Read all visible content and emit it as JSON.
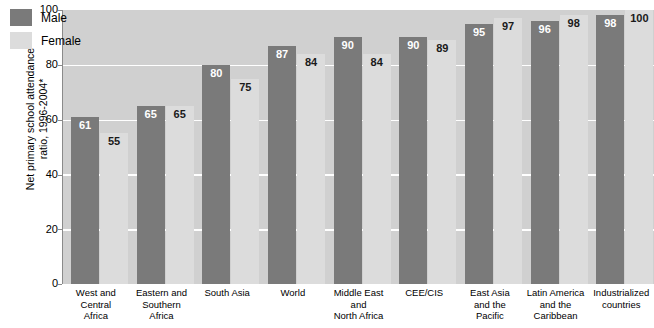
{
  "chart_data": {
    "type": "bar",
    "title": "",
    "subtitle": "",
    "xlabel": "",
    "ylabel": "Net primary school attendance ratio, 1996-2004*",
    "ylabel_lines": [
      "Net primary school attendance",
      "ratio, 1996-2004*"
    ],
    "ylim": [
      0,
      100
    ],
    "yticks": [
      100,
      80,
      60,
      40,
      20,
      0
    ],
    "ytick_labels": [
      "100",
      "80",
      "60",
      "40",
      "20",
      "0"
    ],
    "gridlines": [
      80,
      60,
      40,
      20
    ],
    "grid": true,
    "legend_position": "top-left",
    "categories": [
      "West and Central Africa",
      "Eastern and Southern Africa",
      "South Asia",
      "World",
      "Middle East and North Africa",
      "CEE/CIS",
      "East Asia and the Pacific",
      "Latin America and the Caribbean",
      "Industrialized countries"
    ],
    "category_lines": [
      [
        "West and",
        "Central",
        "Africa"
      ],
      [
        "Eastern and",
        "Southern",
        "Africa"
      ],
      [
        "South Asia"
      ],
      [
        "World"
      ],
      [
        "Middle East and",
        "North Africa"
      ],
      [
        "CEE/CIS"
      ],
      [
        "East Asia",
        "and the",
        "Pacific"
      ],
      [
        "Latin America",
        "and the",
        "Caribbean"
      ],
      [
        "Industrialized",
        "countries"
      ]
    ],
    "series": [
      {
        "name": "Male",
        "color": "#7a7a7a",
        "values": [
          61,
          65,
          80,
          87,
          90,
          90,
          95,
          96,
          98
        ]
      },
      {
        "name": "Female",
        "color": "#dcdcdc",
        "values": [
          55,
          65,
          75,
          84,
          84,
          89,
          97,
          98,
          100
        ]
      }
    ]
  },
  "legend": {
    "items": [
      {
        "label": "Male",
        "color": "#7a7a7a"
      },
      {
        "label": "Female",
        "color": "#dcdcdc"
      }
    ]
  },
  "colors": {
    "male": "#7a7a7a",
    "female": "#dcdcdc",
    "plot_background": "#d0d0d0",
    "gridline": "#ffffff",
    "axis": "#8a8a8a",
    "text": "#000000"
  }
}
